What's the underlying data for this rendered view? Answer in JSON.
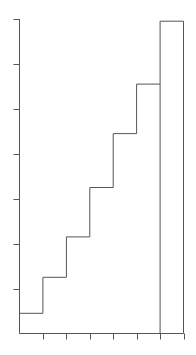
{
  "chart_data": {
    "type": "step",
    "title": "",
    "xlabel": "",
    "ylabel": "",
    "x_edges": [
      0,
      1,
      2,
      3,
      4,
      5,
      6,
      7
    ],
    "values": [
      0.45,
      1.25,
      2.15,
      3.25,
      4.45,
      5.55,
      6.95
    ],
    "ylim": [
      0,
      7
    ],
    "y_ticks": [
      1,
      2,
      3,
      4,
      5,
      6,
      7
    ],
    "x_ticks": [
      1,
      2,
      3,
      4,
      5,
      6,
      7
    ],
    "tick_labels_visible": false,
    "grid": false,
    "line_color": "#555555"
  }
}
